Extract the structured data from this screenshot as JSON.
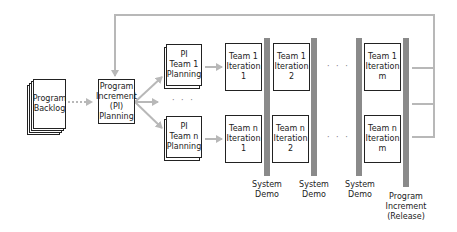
{
  "diagram": {
    "title": "",
    "colors": {
      "arrow": "#b8b8b8",
      "bar": "#8a8a8a",
      "box_border": "#222222"
    },
    "backlog": {
      "label": "Program\nBacklog"
    },
    "pi_planning": {
      "label": "Program\nIncrement\n(PI)\nPlanning"
    },
    "team_planning": [
      {
        "label": "PI\nTeam 1\nPlanning"
      },
      {
        "label": "PI\nTeam n\nPlanning"
      }
    ],
    "iterations": {
      "team1": [
        {
          "label": "Team 1\nIteration\n1"
        },
        {
          "label": "Team 1\nIteration\n2"
        },
        {
          "label": "Team 1\nIteration\nm"
        }
      ],
      "teamn": [
        {
          "label": "Team n\nIteration\n1"
        },
        {
          "label": "Team n\nIteration\n2"
        },
        {
          "label": "Team n\nIteration\nm"
        }
      ]
    },
    "ellipsis": "· · ·",
    "milestones": [
      {
        "label": "System\nDemo"
      },
      {
        "label": "System\nDemo"
      },
      {
        "label": "System\nDemo"
      },
      {
        "label": "Program\nIncrement\n(Release)"
      }
    ]
  }
}
